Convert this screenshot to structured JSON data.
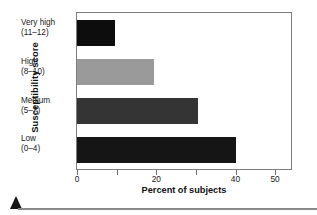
{
  "chart_data": {
    "type": "bar",
    "orientation": "horizontal",
    "title": "",
    "xlabel": "Percent of subjects",
    "ylabel": "Susceptibility score",
    "categories": [
      "Very high\n(11–12)",
      "High\n(8–10)",
      "Medium\n(5–7)",
      "Low\n(0–4)"
    ],
    "category_lines": [
      {
        "line1": "Very high",
        "line2": "(11–12)"
      },
      {
        "line1": "High",
        "line2": "(8–10)"
      },
      {
        "line1": "Medium",
        "line2": "(5–7)"
      },
      {
        "line1": "Low",
        "line2": "(0–4)"
      }
    ],
    "values": [
      9.5,
      19.5,
      30.5,
      40
    ],
    "bar_colors": [
      "#0d0d0d",
      "#9a9a9a",
      "#343434",
      "#151515"
    ],
    "xlim": [
      0,
      54
    ],
    "ylim": [
      0,
      4
    ],
    "xticks": [
      0,
      10,
      20,
      30,
      40,
      50
    ],
    "xticklabels": [
      "0",
      "",
      "20",
      "",
      "40",
      "50"
    ],
    "grid": false,
    "legend": false,
    "frame": true,
    "axis_color": "#7d7d7d"
  },
  "labels": {
    "ylabel": "Susceptibility score",
    "xlabel": "Percent of subjects",
    "ticks": [
      "0",
      "20",
      "40",
      "50"
    ]
  },
  "footer": {
    "marker": "triangle-marker",
    "rule": "horizontal-rule"
  }
}
